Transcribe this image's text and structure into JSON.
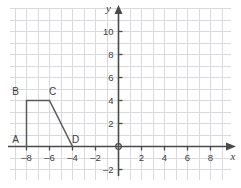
{
  "figure": {
    "type": "coordinate-plane",
    "background_color": "#ffffff",
    "grid_color": "#d9d9de",
    "axis_color": "#4a4a4a",
    "shape_color": "#5a5a5a",
    "label_color": "#404040"
  },
  "axes": {
    "x_label": "x",
    "y_label": "y",
    "origin_label": "O",
    "x_range": [
      -9.5,
      9.5
    ],
    "y_range": [
      -2.8,
      11.3
    ],
    "x_ticks": [
      -8,
      -6,
      -4,
      -2,
      2,
      4,
      6,
      8
    ],
    "y_ticks": [
      -2,
      2,
      4,
      6,
      8,
      10
    ],
    "x_tick_labels": [
      "–8",
      "–6",
      "–4",
      "–2",
      "2",
      "4",
      "6",
      "8"
    ],
    "y_tick_labels": [
      "–2",
      "2",
      "4",
      "6",
      "8",
      "10"
    ],
    "grid": true,
    "grid_step": 1
  },
  "chart_data": {
    "type": "scatter",
    "title": "",
    "xlabel": "x",
    "ylabel": "y",
    "xlim": [
      -9.5,
      9.5
    ],
    "ylim": [
      -2.8,
      11.3
    ],
    "grid": true,
    "xticks": [
      -8,
      -6,
      -4,
      -2,
      2,
      4,
      6,
      8
    ],
    "yticks": [
      -2,
      2,
      4,
      6,
      8,
      10
    ],
    "annotations": [
      "A",
      "B",
      "C",
      "D"
    ],
    "series": [
      {
        "name": "trapezoid ABCD",
        "closed": false,
        "points": [
          {
            "label": "A",
            "x": -8,
            "y": 0
          },
          {
            "label": "B",
            "x": -8,
            "y": 4
          },
          {
            "label": "C",
            "x": -6,
            "y": 4
          },
          {
            "label": "D",
            "x": -4,
            "y": 0
          }
        ]
      }
    ]
  },
  "vertices": [
    {
      "label": "A",
      "x": -8,
      "y": 0,
      "label_dx": -11,
      "label_dy": -4
    },
    {
      "label": "B",
      "x": -8,
      "y": 4,
      "label_dx": -11,
      "label_dy": -6
    },
    {
      "label": "C",
      "x": -6,
      "y": 4,
      "label_dx": 3,
      "label_dy": -6
    },
    {
      "label": "D",
      "x": -4,
      "y": 0,
      "label_dx": 3,
      "label_dy": -4
    }
  ]
}
